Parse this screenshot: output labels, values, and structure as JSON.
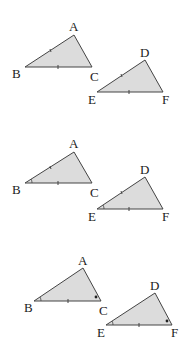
{
  "figure": {
    "colors": {
      "fill": "#dcdcdc",
      "stroke": "#444444",
      "text": "#222222",
      "background": "#ffffff"
    },
    "pairs": [
      {
        "name": "pair-1",
        "marks": "two equal sides marked (AB=DE, BC=EF)",
        "triangle_abc": {
          "labels": {
            "A": "A",
            "B": "B",
            "C": "C"
          }
        },
        "triangle_def": {
          "labels": {
            "D": "D",
            "E": "E",
            "F": "F"
          }
        }
      },
      {
        "name": "pair-2",
        "marks": "two equal sides and included angle B=E marked",
        "triangle_abc": {
          "labels": {
            "A": "A",
            "B": "B",
            "C": "C"
          }
        },
        "triangle_def": {
          "labels": {
            "D": "D",
            "E": "E",
            "F": "F"
          }
        }
      },
      {
        "name": "pair-3",
        "marks": "side BC=EF with angles B=E (arc) and C=F (dot) marked",
        "triangle_abc": {
          "labels": {
            "A": "A",
            "B": "B",
            "C": "C"
          }
        },
        "triangle_def": {
          "labels": {
            "D": "D",
            "E": "E",
            "F": "F"
          }
        }
      }
    ]
  }
}
